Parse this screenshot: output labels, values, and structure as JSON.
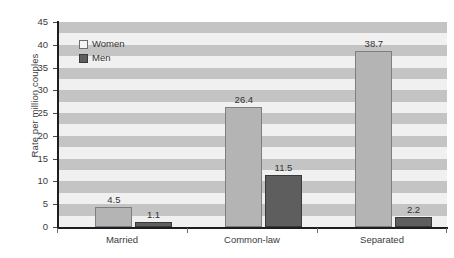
{
  "chart_data": {
    "type": "bar",
    "title": "",
    "subtitle": "",
    "xlabel": "",
    "ylabel": "Rate per million couples",
    "categories": [
      "Married",
      "Common-law",
      "Separated"
    ],
    "series": [
      {
        "name": "Women",
        "values": [
          4.5,
          26.4,
          38.7
        ],
        "color": "#b4b4b4"
      },
      {
        "name": "Men",
        "values": [
          1.1,
          11.5,
          2.2
        ],
        "color": "#5e5e5e"
      }
    ],
    "value_labels": [
      [
        "4.5",
        "26.4",
        "38.7"
      ],
      [
        "1.1",
        "11.5",
        "2.2"
      ]
    ],
    "ylim": [
      0,
      45
    ],
    "ytick_values": [
      0,
      5,
      10,
      15,
      20,
      25,
      30,
      35,
      40,
      45
    ],
    "ytick_labels": [
      "0",
      "5",
      "10",
      "15",
      "20",
      "25",
      "30",
      "35",
      "40",
      "45"
    ],
    "grid": "horizontal-alternating-bands",
    "band_interval": 2.5,
    "legend_position": "inside-top-left",
    "plot_background": "#f0f0f0",
    "band_color": "#c4c4c4",
    "axis_color": "#1e1e1e",
    "text_color": "#3b3b3b"
  },
  "legend": {
    "items": [
      {
        "label": "Women"
      },
      {
        "label": "Men"
      }
    ]
  }
}
